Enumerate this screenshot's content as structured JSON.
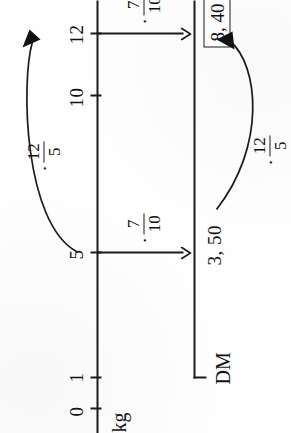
{
  "figure": {
    "type": "proportionality-double-number-line"
  },
  "axes": {
    "top": {
      "name": "kg",
      "ticks": [
        {
          "label": "0"
        },
        {
          "label": "1"
        },
        {
          "label": "5"
        },
        {
          "label": "10"
        },
        {
          "label": "12"
        }
      ]
    },
    "bottom": {
      "name": "DM",
      "values": {
        "lower": "3, 50",
        "upper": "8, 40"
      }
    }
  },
  "operators": {
    "down_lower": {
      "dot": "·",
      "numerator": "7",
      "denominator": "10"
    },
    "down_upper": {
      "dot": "·",
      "numerator": "7",
      "denominator": "10"
    },
    "curve_top": {
      "dot": "·",
      "numerator": "12",
      "denominator": "5"
    },
    "curve_bottom": {
      "dot": "·",
      "numerator": "12",
      "denominator": "5"
    }
  },
  "result": {
    "boxed_value": "8, 40"
  },
  "colors": {
    "ink": "#1a1a1a",
    "paper": "#fefefe"
  }
}
